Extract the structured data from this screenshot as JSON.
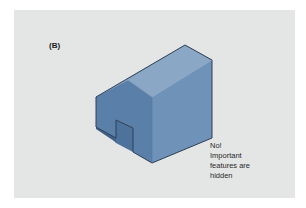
{
  "figure": {
    "panel_label": "(B)",
    "caption_lines": [
      "No!",
      "Important",
      "features are",
      "hidden"
    ],
    "colors": {
      "panel_background": "#e4e5e5",
      "top_face": "#7f9dbd",
      "front_face": "#5c82ac",
      "side_face": "#6d8fb6",
      "notch_face": "#4a6f99",
      "outline": "#2e3f55"
    },
    "object": "isometric-notched-block"
  }
}
